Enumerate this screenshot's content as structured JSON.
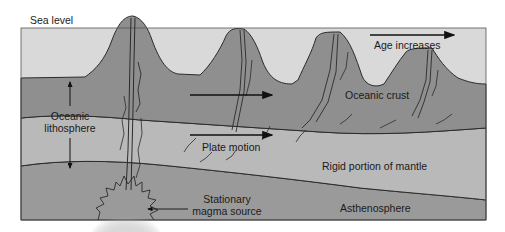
{
  "diagram": {
    "colors": {
      "ocean": "#d9d9d9",
      "crust": "#8f8f8f",
      "rigid_mantle": "#b8b8b8",
      "asthenosphere": "#999999",
      "outline": "#2b2b2b",
      "magma_glow": "#f4f4f4"
    },
    "labels": {
      "sea_level": "Sea level",
      "oceanic_lithosphere": [
        "Oceanic",
        "lithosphere"
      ],
      "oceanic_crust": "Oceanic crust",
      "age_increases": "Age increases",
      "plate_motion": "Plate motion",
      "rigid_mantle": "Rigid portion of mantle",
      "asthenosphere": "Asthenosphere",
      "magma_source": [
        "Stationary",
        "magma source"
      ]
    },
    "layers": [
      {
        "name": "Ocean water",
        "order": 1
      },
      {
        "name": "Oceanic crust",
        "order": 2
      },
      {
        "name": "Rigid portion of mantle",
        "order": 3
      },
      {
        "name": "Asthenosphere",
        "order": 4
      }
    ],
    "volcanoes": [
      {
        "position": 1,
        "peak_height": "highest",
        "active": true
      },
      {
        "position": 2,
        "peak_height": "high",
        "active": false
      },
      {
        "position": 3,
        "peak_height": "lower",
        "active": false
      },
      {
        "position": 4,
        "peak_height": "lowest",
        "active": false
      }
    ],
    "arrows": [
      {
        "name": "age-increases-arrow",
        "direction": "right"
      },
      {
        "name": "plate-motion-arrow-upper",
        "direction": "right"
      },
      {
        "name": "plate-motion-arrow-lower",
        "direction": "right"
      },
      {
        "name": "lithosphere-thickness-arrow",
        "direction": "both"
      },
      {
        "name": "magma-source-pointer",
        "direction": "left"
      }
    ]
  }
}
